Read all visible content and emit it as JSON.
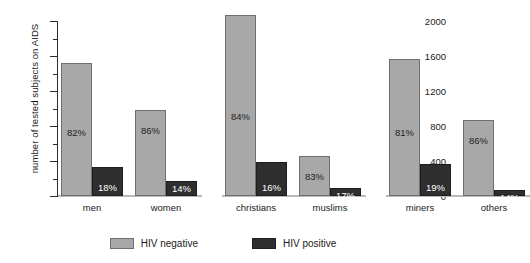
{
  "chart_data": {
    "type": "bar",
    "title": "",
    "xlabel": "",
    "ylabel": "number of tested subjects on AIDS",
    "ylim": [
      0,
      2000
    ],
    "yticks": [
      0,
      400,
      800,
      1200,
      1600,
      2000
    ],
    "ytick_labels": [
      "0",
      "400",
      "800",
      "1200",
      "1600",
      "2000"
    ],
    "minor_ticks": [
      200,
      600,
      1000,
      1400,
      1800
    ],
    "grid": false,
    "legend_position": "bottom-center",
    "legend": [
      "HIV negative",
      "HIV positive"
    ],
    "groups": [
      "men",
      "women",
      "christians",
      "muslims",
      "miners",
      "others"
    ],
    "group_separators": [
      2,
      4
    ],
    "categories": [
      "men",
      "women",
      "christians",
      "muslims",
      "miners",
      "others"
    ],
    "series": [
      {
        "name": "HIV negative",
        "color": "#a8a8a8",
        "values": [
          1520,
          980,
          2070,
          460,
          1565,
          870
        ],
        "labels": [
          "82%",
          "86%",
          "84%",
          "83%",
          "81%",
          "86%"
        ]
      },
      {
        "name": "HIV positive",
        "color": "#2e2e2e",
        "values": [
          330,
          170,
          390,
          95,
          365,
          70
        ],
        "labels": [
          "18%",
          "14%",
          "16%",
          "17%",
          "19%",
          "14%"
        ]
      }
    ]
  },
  "axis": {
    "y_title": "number of tested subjects on AIDS"
  },
  "legend": {
    "items": [
      {
        "label": "HIV negative",
        "key": "neg"
      },
      {
        "label": "HIV positive",
        "key": "pos"
      }
    ]
  }
}
